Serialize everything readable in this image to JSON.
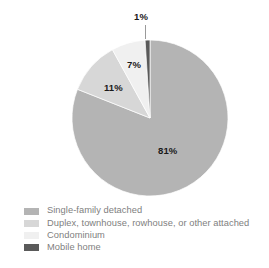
{
  "chart_data": {
    "type": "pie",
    "title": "",
    "xlabel": "",
    "ylabel": "",
    "legend_position": "bottom-left",
    "grid": false,
    "start_angle_deg": 0,
    "direction": "clockwise",
    "categories": [
      "Single-family detached",
      "Duplex, townhouse, rowhouse, or other attached",
      "Condominium",
      "Mobile home"
    ],
    "values": [
      81,
      11,
      7,
      1
    ],
    "value_labels": [
      "81%",
      "11%",
      "7%",
      "1%"
    ],
    "colors": [
      "#b4b4b4",
      "#d7d7d7",
      "#f0f0f0",
      "#5a5a5a"
    ],
    "slices": [
      {
        "label": "Single-family detached",
        "value": 81,
        "value_label": "81%",
        "color": "#b4b4b4"
      },
      {
        "label": "Duplex, townhouse, rowhouse, or other attached",
        "value": 11,
        "value_label": "11%",
        "color": "#d7d7d7"
      },
      {
        "label": "Condominium",
        "value": 7,
        "value_label": "7%",
        "color": "#f0f0f0"
      },
      {
        "label": "Mobile home",
        "value": 1,
        "value_label": "1%",
        "color": "#5a5a5a"
      }
    ]
  },
  "legend": {
    "items": [
      {
        "label": "Single-family detached",
        "color": "#b4b4b4"
      },
      {
        "label": "Duplex, townhouse, rowhouse, or other attached",
        "color": "#d7d7d7"
      },
      {
        "label": "Condominium",
        "color": "#f0f0f0"
      },
      {
        "label": "Mobile home",
        "color": "#5a5a5a"
      }
    ]
  },
  "footnote": {
    "text": ""
  }
}
